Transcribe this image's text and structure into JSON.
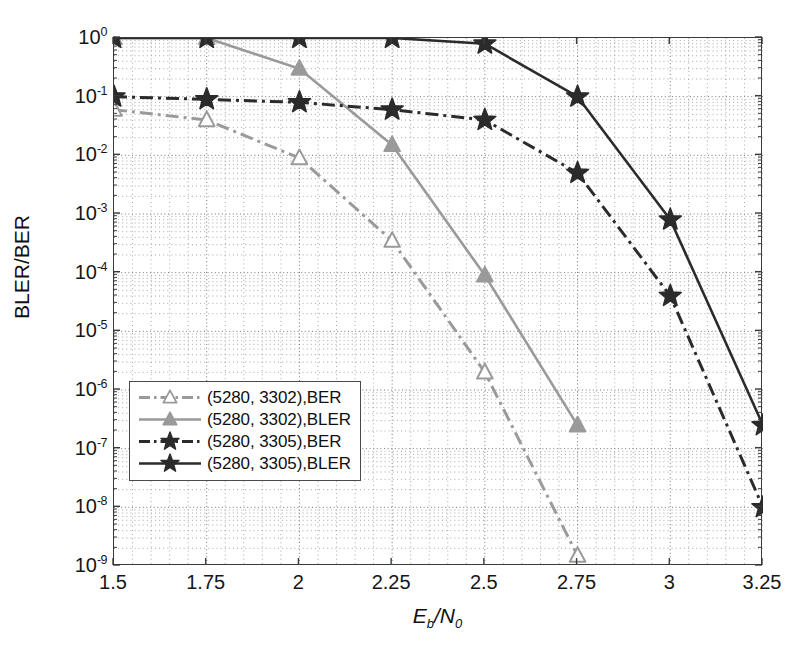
{
  "chart_data": {
    "type": "line",
    "title": "",
    "xlabel": "Eb/N0",
    "ylabel": "BLER/BER",
    "xlabel_parts": {
      "main": "E",
      "sub1": "b",
      "slash": "/N",
      "sub2": "0"
    },
    "x": [
      1.5,
      1.75,
      2,
      2.25,
      2.5,
      2.75,
      3,
      3.25
    ],
    "xticklabels": [
      "1.5",
      "1.75",
      "2",
      "2.25",
      "2.5",
      "2.75",
      "3",
      "3.25"
    ],
    "xlim": [
      1.5,
      3.25
    ],
    "ylim": [
      1e-09,
      1
    ],
    "yscale": "log",
    "yticklabels": [
      "10^0",
      "10^-1",
      "10^-2",
      "10^-3",
      "10^-4",
      "10^-5",
      "10^-6",
      "10^-7",
      "10^-8",
      "10^-9"
    ],
    "yticks_exponents": [
      0,
      -1,
      -2,
      -3,
      -4,
      -5,
      -6,
      -7,
      -8,
      -9
    ],
    "grid": true,
    "grid_minor": true,
    "legend_position": "lower left",
    "series": [
      {
        "name": "(5280, 3302),BER",
        "color": "#9a9a9a",
        "marker": "triangle",
        "marker_filled": false,
        "linestyle": "dashdot",
        "x": [
          1.5,
          1.75,
          2,
          2.25,
          2.5,
          2.75
        ],
        "values": [
          0.06,
          0.04,
          0.009,
          0.00035,
          2e-06,
          1.5e-09
        ]
      },
      {
        "name": "(5280, 3302),BLER",
        "color": "#9a9a9a",
        "marker": "triangle",
        "marker_filled": true,
        "linestyle": "solid",
        "x": [
          1.5,
          1.75,
          2,
          2.25,
          2.5,
          2.75
        ],
        "values": [
          1.0,
          1.0,
          0.3,
          0.015,
          9e-05,
          2.5e-07
        ]
      },
      {
        "name": "(5280, 3305),BER",
        "color": "#2b2b2b",
        "marker": "star",
        "marker_filled": true,
        "linestyle": "dashdot",
        "x": [
          1.5,
          1.75,
          2,
          2.25,
          2.5,
          2.75,
          3,
          3.25
        ],
        "values": [
          0.1,
          0.09,
          0.08,
          0.06,
          0.04,
          0.005,
          4e-05,
          1e-08
        ]
      },
      {
        "name": "(5280, 3305),BLER",
        "color": "#2b2b2b",
        "marker": "star",
        "marker_filled": true,
        "linestyle": "solid",
        "x": [
          1.5,
          1.75,
          2,
          2.25,
          2.5,
          2.75,
          3,
          3.25
        ],
        "values": [
          1.0,
          1.0,
          1.0,
          1.0,
          0.8,
          0.1,
          0.0008,
          2.5e-07
        ]
      }
    ]
  },
  "legend": {
    "items": [
      {
        "label": "(5280, 3302),BER"
      },
      {
        "label": "(5280, 3302),BLER"
      },
      {
        "label": "(5280, 3305),BER"
      },
      {
        "label": "(5280, 3305),BLER"
      }
    ]
  }
}
